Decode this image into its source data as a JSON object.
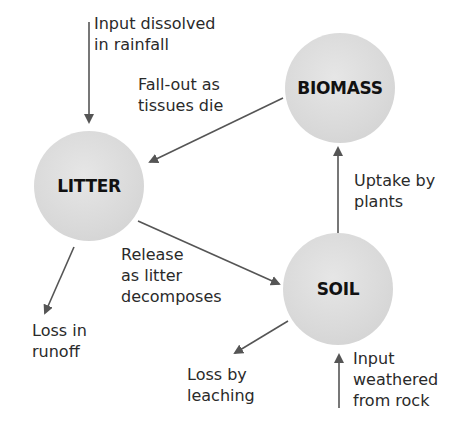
{
  "nodes": {
    "litter": {
      "label": "LITTER"
    },
    "biomass": {
      "label": "BIOMASS"
    },
    "soil": {
      "label": "SOIL"
    }
  },
  "flows": {
    "input_rainfall": "Input dissolved\nin rainfall",
    "fall_out": "Fall-out as\ntissues die",
    "uptake": "Uptake by\nplants",
    "release": "Release\nas litter\ndecomposes",
    "loss_runoff": "Loss in\nrunoff",
    "loss_leaching": "Loss by\nleaching",
    "input_weathered": "Input\nweathered\nfrom rock"
  },
  "colors": {
    "node_fill": "#d9d9d9",
    "arrow": "#555555",
    "text": "#2a2a2a"
  }
}
